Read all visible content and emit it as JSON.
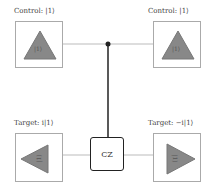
{
  "qubits": [
    {
      "label": "Control: |1⟩",
      "state": "|1⟩",
      "orientation": "up"
    },
    {
      "label": "Control: |1⟩",
      "state": "|1⟩",
      "orientation": "up"
    },
    {
      "label": "Target: i|1⟩",
      "state": "|1⟩",
      "orientation": "left"
    },
    {
      "label": "Target: −i|1⟩",
      "state": "|1⟩",
      "orientation": "right"
    }
  ],
  "gate": {
    "label": "CZ"
  },
  "colors": {
    "triangle": "#888888",
    "wire": "#222222",
    "connector": "#bbbbbb"
  }
}
